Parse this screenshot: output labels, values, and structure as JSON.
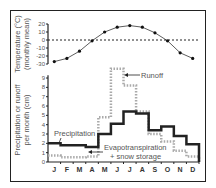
{
  "chart_data": [
    {
      "type": "line",
      "title": "",
      "ylabel": "Temperature (°C) (monthly mean)",
      "ylabel_lines": [
        "Temperature (°C)",
        "(monthly mean)"
      ],
      "yticks": [
        20,
        10,
        0,
        -10,
        -20,
        -30
      ],
      "ylim": [
        -30,
        20
      ],
      "reference_line": {
        "y": 0,
        "style": "dashed"
      },
      "categories": [
        "J",
        "F",
        "M",
        "A",
        "M",
        "J",
        "J",
        "A",
        "S",
        "O",
        "N",
        "D"
      ],
      "values": [
        -27,
        -23,
        -14,
        -1,
        10,
        16,
        18,
        16,
        9,
        -1,
        -16,
        -23
      ]
    },
    {
      "type": "bar",
      "style": "step",
      "ylabel": "Precipitation or runoff per month (cm)",
      "ylabel_lines": [
        "Precipitation or runoff",
        "per month (cm)"
      ],
      "yticks": [
        0,
        1,
        2,
        3,
        4,
        5,
        6,
        7,
        8,
        9
      ],
      "ylim": [
        0,
        9
      ],
      "categories": [
        "J",
        "F",
        "M",
        "A",
        "M",
        "J",
        "J",
        "A",
        "S",
        "O",
        "N",
        "D"
      ],
      "series": [
        {
          "name": "Precipitation",
          "style": "solid-black-step",
          "values": [
            2.0,
            1.8,
            1.8,
            1.6,
            3.0,
            4.1,
            5.4,
            5.2,
            3.4,
            3.8,
            2.8,
            1.9
          ]
        },
        {
          "name": "Runoff",
          "style": "dotted-gray-step",
          "values": [
            0.7,
            0.5,
            0.5,
            0.6,
            4.8,
            10.0,
            8.2,
            5.4,
            3.0,
            2.2,
            1.2,
            0.6
          ]
        }
      ],
      "annotations": [
        {
          "text": "Runoff",
          "arrow_to": "Runoff series at June"
        },
        {
          "text": "Precipitation",
          "arrow_to": "Precipitation series at January"
        },
        {
          "text": "Evapotranspiration",
          "arrow_to": "gap between precipitation and runoff in April"
        },
        {
          "text": "+ snow storage"
        }
      ]
    }
  ],
  "labels": {
    "temp_axis_line1": "Temperature (°C)",
    "temp_axis_line2": "(monthly mean)",
    "precip_axis_line1": "Precipitation or runoff",
    "precip_axis_line2": "per month (cm)",
    "runoff": "Runoff",
    "precipitation": "Precipitation",
    "evap1": "Evapotranspiration",
    "evap2": "+ snow storage"
  }
}
